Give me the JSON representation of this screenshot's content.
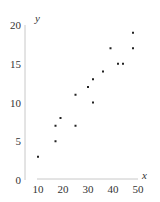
{
  "chart_data": {
    "type": "scatter",
    "title": "",
    "xlabel": "x",
    "ylabel": "y",
    "xlim": [
      10,
      50
    ],
    "ylim": [
      0,
      20
    ],
    "x_ticks": [
      10,
      20,
      30,
      40,
      50
    ],
    "y_ticks": [
      0,
      5,
      10,
      15,
      20
    ],
    "grid": false,
    "legend": null,
    "points": [
      {
        "x": 10,
        "y": 3
      },
      {
        "x": 17,
        "y": 5
      },
      {
        "x": 17,
        "y": 7
      },
      {
        "x": 19,
        "y": 8
      },
      {
        "x": 25,
        "y": 7
      },
      {
        "x": 25,
        "y": 11
      },
      {
        "x": 30,
        "y": 12
      },
      {
        "x": 32,
        "y": 10
      },
      {
        "x": 32,
        "y": 13
      },
      {
        "x": 36,
        "y": 14
      },
      {
        "x": 39,
        "y": 17
      },
      {
        "x": 42,
        "y": 15
      },
      {
        "x": 44,
        "y": 15
      },
      {
        "x": 48,
        "y": 17
      },
      {
        "x": 48,
        "y": 19
      }
    ],
    "colors": {
      "point": "#222222",
      "axis": "#c8c8c8",
      "text": "#333333"
    }
  }
}
